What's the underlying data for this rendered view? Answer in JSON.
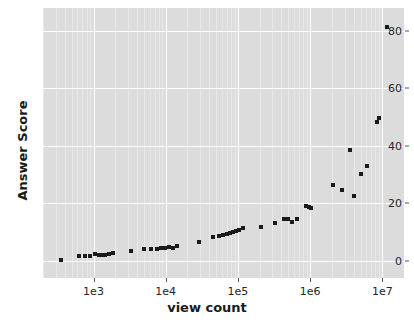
{
  "chart_data": {
    "type": "scatter",
    "title": "",
    "xlabel": "view count",
    "ylabel": "Answer Score",
    "xscale": "log",
    "yscale": "linear",
    "xlim": [
      200,
      20000000
    ],
    "ylim": [
      -6,
      88
    ],
    "grid": true,
    "legend": null,
    "marker": "x-square",
    "marker_color": "#1a1a1a",
    "background_color": "#dcdcdc",
    "gridline_color": "#ffffff",
    "xticks": [
      {
        "value": 1000,
        "label": "1e3"
      },
      {
        "value": 10000,
        "label": "1e4"
      },
      {
        "value": 100000,
        "label": "1e5"
      },
      {
        "value": 1000000,
        "label": "1e6"
      },
      {
        "value": 10000000,
        "label": "1e7"
      }
    ],
    "yticks": [
      {
        "value": 0,
        "label": "0"
      },
      {
        "value": 20,
        "label": "20"
      },
      {
        "value": 40,
        "label": "40"
      },
      {
        "value": 60,
        "label": "60"
      },
      {
        "value": 80,
        "label": "80"
      }
    ],
    "points": [
      {
        "x": 350,
        "y": 0.3
      },
      {
        "x": 620,
        "y": 1.8
      },
      {
        "x": 760,
        "y": 1.6
      },
      {
        "x": 900,
        "y": 1.7
      },
      {
        "x": 1050,
        "y": 2.4
      },
      {
        "x": 1180,
        "y": 1.9
      },
      {
        "x": 1300,
        "y": 2.0
      },
      {
        "x": 1450,
        "y": 2.1
      },
      {
        "x": 1650,
        "y": 2.4
      },
      {
        "x": 1850,
        "y": 2.6
      },
      {
        "x": 3300,
        "y": 3.5
      },
      {
        "x": 5000,
        "y": 4.2
      },
      {
        "x": 6300,
        "y": 4.0
      },
      {
        "x": 7600,
        "y": 4.2
      },
      {
        "x": 8700,
        "y": 4.5
      },
      {
        "x": 9800,
        "y": 4.4
      },
      {
        "x": 11000,
        "y": 4.8
      },
      {
        "x": 12500,
        "y": 4.6
      },
      {
        "x": 14500,
        "y": 5.1
      },
      {
        "x": 29000,
        "y": 6.7
      },
      {
        "x": 45000,
        "y": 8.2
      },
      {
        "x": 54000,
        "y": 8.5
      },
      {
        "x": 62000,
        "y": 9.0
      },
      {
        "x": 70000,
        "y": 9.3
      },
      {
        "x": 78000,
        "y": 9.6
      },
      {
        "x": 86000,
        "y": 10.0
      },
      {
        "x": 95000,
        "y": 10.4
      },
      {
        "x": 105000,
        "y": 10.8
      },
      {
        "x": 118000,
        "y": 11.3
      },
      {
        "x": 210000,
        "y": 11.9
      },
      {
        "x": 330000,
        "y": 13.1
      },
      {
        "x": 430000,
        "y": 14.4
      },
      {
        "x": 490000,
        "y": 14.6
      },
      {
        "x": 560000,
        "y": 13.5
      },
      {
        "x": 660000,
        "y": 14.7
      },
      {
        "x": 870000,
        "y": 19.2
      },
      {
        "x": 960000,
        "y": 18.6
      },
      {
        "x": 1020000,
        "y": 18.3
      },
      {
        "x": 2100000,
        "y": 26.3
      },
      {
        "x": 2800000,
        "y": 24.5
      },
      {
        "x": 3600000,
        "y": 38.7
      },
      {
        "x": 4100000,
        "y": 22.7
      },
      {
        "x": 5100000,
        "y": 30.1
      },
      {
        "x": 6200000,
        "y": 33.0
      },
      {
        "x": 8400000,
        "y": 48.3
      },
      {
        "x": 9100000,
        "y": 49.8
      },
      {
        "x": 11500000,
        "y": 81.3
      }
    ]
  }
}
